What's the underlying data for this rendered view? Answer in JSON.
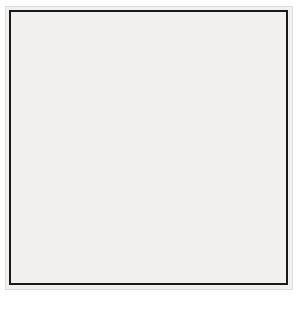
{
  "figure": {
    "kind": "go-board-diagram",
    "board_size": 19,
    "colors": {
      "board": "#f1f0ee",
      "line": "#2a2a2a",
      "border": "#1a1a1a",
      "black_stone": "#0a0a0a",
      "white_stone": "#fbfbfb"
    }
  },
  "geometry": {
    "origin_x": 9,
    "origin_y": 10,
    "spacing": 15.5,
    "columns_visible": 19,
    "rows_visible": 18
  },
  "star_points": [
    {
      "col": 4,
      "row": 4
    },
    {
      "col": 10,
      "row": 4
    },
    {
      "col": 16,
      "row": 4
    },
    {
      "col": 4,
      "row": 10
    },
    {
      "col": 10,
      "row": 10
    },
    {
      "col": 16,
      "row": 10
    },
    {
      "col": 4,
      "row": 16
    },
    {
      "col": 10,
      "row": 16
    },
    {
      "col": 16,
      "row": 16
    }
  ],
  "stones": [
    {
      "color": "white",
      "col": 12,
      "row": 2,
      "name": "white-stone-l18"
    },
    {
      "color": "white",
      "col": 13,
      "row": 2,
      "name": "white-stone-m18"
    },
    {
      "color": "black",
      "col": 11,
      "row": 3,
      "name": "black-stone-k17"
    },
    {
      "color": "black",
      "col": 12,
      "row": 3,
      "name": "black-stone-l17"
    },
    {
      "color": "black",
      "col": 13,
      "row": 3,
      "name": "black-stone-m17"
    },
    {
      "color": "white",
      "col": 14,
      "row": 3,
      "name": "white-stone-n17"
    },
    {
      "color": "white",
      "col": 15,
      "row": 3,
      "name": "white-stone-o17"
    },
    {
      "color": "white",
      "col": 16,
      "row": 3,
      "name": "white-stone-p17"
    },
    {
      "color": "white",
      "col": 17,
      "row": 3,
      "name": "white-stone-q17"
    },
    {
      "color": "black",
      "col": 14,
      "row": 4,
      "name": "black-stone-n16"
    },
    {
      "color": "white",
      "col": 15,
      "row": 4,
      "name": "white-stone-o16"
    },
    {
      "color": "black",
      "col": 16,
      "row": 4,
      "name": "black-stone-p16"
    },
    {
      "color": "black",
      "col": 17,
      "row": 4,
      "name": "black-stone-q16"
    },
    {
      "color": "black",
      "col": 18,
      "row": 4,
      "name": "black-stone-r16"
    },
    {
      "color": "black",
      "col": 14,
      "row": 5,
      "name": "black-stone-n15"
    },
    {
      "color": "black",
      "col": 15,
      "row": 5,
      "name": "black-stone-o15"
    },
    {
      "color": "white",
      "col": 16,
      "row": 5,
      "name": "white-stone-p15"
    },
    {
      "color": "white",
      "col": 17,
      "row": 5,
      "name": "white-stone-q15"
    },
    {
      "color": "black",
      "col": 16,
      "row": 6,
      "name": "black-stone-p14"
    },
    {
      "color": "white",
      "col": 4,
      "row": 4,
      "name": "white-stone-d16"
    },
    {
      "color": "white",
      "col": 4,
      "row": 10,
      "name": "white-stone-d10"
    },
    {
      "color": "white",
      "col": 4,
      "row": 16,
      "name": "white-stone-d4"
    },
    {
      "color": "black",
      "col": 10,
      "row": 16,
      "name": "black-stone-k4"
    },
    {
      "color": "black",
      "col": 16,
      "row": 15,
      "name": "black-stone-p5"
    },
    {
      "color": "black",
      "col": 16,
      "row": 17,
      "name": "black-stone-p3"
    }
  ],
  "moves": [
    {
      "label": "1",
      "color": "white",
      "col": 18,
      "row": 6,
      "name": "move-marker-1"
    },
    {
      "label": "2",
      "color": "black",
      "col": 18,
      "row": 7,
      "name": "move-marker-2"
    },
    {
      "label": "3",
      "color": "white",
      "col": 18,
      "row": 5,
      "name": "move-marker-3"
    },
    {
      "label": "4",
      "color": "black",
      "col": 19,
      "row": 6,
      "name": "move-marker-4"
    },
    {
      "label": "5",
      "color": "white",
      "col": 18,
      "row": 3,
      "name": "move-marker-5"
    },
    {
      "label": "6",
      "color": "black",
      "col": 17,
      "row": 8,
      "name": "move-marker-6"
    }
  ],
  "letters": [
    {
      "label": "A",
      "col": 17,
      "row": 6,
      "name": "point-label-a"
    },
    {
      "label": "B",
      "col": 19,
      "row": 7,
      "name": "point-label-b"
    }
  ]
}
